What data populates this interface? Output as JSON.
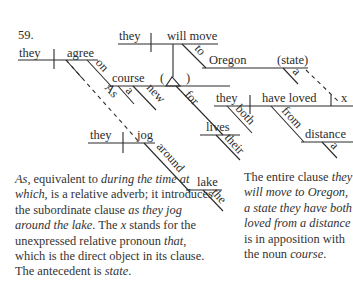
{
  "diagram": {
    "number": "59.",
    "main_clause": {
      "subject": "they",
      "verb": "agree",
      "modifiers": {
        "preposition": "on",
        "object": "course",
        "object_modifiers": [
          "a",
          "new"
        ],
        "relative_adverb": "As"
      }
    },
    "appositive_clause": {
      "open_paren": "(",
      "close_paren": ")",
      "subject": "they",
      "verb": "will move",
      "preposition": "to",
      "object": "Oregon",
      "appositive": "(state)",
      "appositive_modifier": "a"
    },
    "for_phrase": {
      "preposition": "for",
      "object": "lives",
      "modifier": "their"
    },
    "relative_clause": {
      "subject": "they",
      "subject_modifier": "both",
      "verb": "have loved",
      "direct_object": "x",
      "preposition": "from",
      "object": "distance",
      "object_modifier": "a"
    },
    "subordinate_clause": {
      "subject": "they",
      "verb": "jog",
      "preposition": "around",
      "object": "lake",
      "object_modifier": "the"
    }
  },
  "notes": {
    "left": [
      {
        "text": "As",
        "italic": true
      },
      {
        "text": ", equivalent to ",
        "italic": false
      },
      {
        "text": "during the time at which",
        "italic": true
      },
      {
        "text": ", is a relative adverb; it introduces the subordinate clause ",
        "italic": false
      },
      {
        "text": "as they jog around the lake",
        "italic": true
      },
      {
        "text": ". The ",
        "italic": false
      },
      {
        "text": "x",
        "italic": true
      },
      {
        "text": " stands for the unexpressed relative pronoun ",
        "italic": false
      },
      {
        "text": "that",
        "italic": true
      },
      {
        "text": ", which is the direct object in its clause. The ante­cedent is ",
        "italic": false
      },
      {
        "text": "state",
        "italic": true
      },
      {
        "text": ".",
        "italic": false
      }
    ],
    "right": [
      {
        "text": "The entire clause ",
        "italic": false
      },
      {
        "text": "they will move to Oregon, a state they have both loved from a distance",
        "italic": true
      },
      {
        "text": " is in apposition with the noun ",
        "italic": false
      },
      {
        "text": "course",
        "italic": true
      },
      {
        "text": ".",
        "italic": false
      }
    ]
  }
}
